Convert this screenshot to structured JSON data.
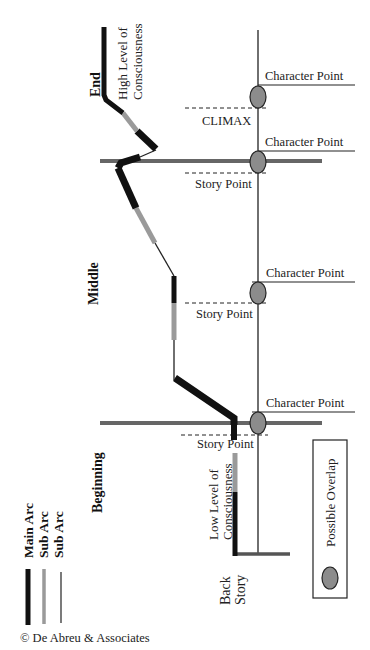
{
  "diagram": {
    "sections": [
      {
        "label": "End"
      },
      {
        "label": "Middle"
      },
      {
        "label": "Beginning"
      }
    ],
    "arc_labels": {
      "high": [
        "High Level of",
        "Consciousness"
      ],
      "low": [
        "Low Level of",
        "Consciousness"
      ],
      "back_story": [
        "Back",
        "Story"
      ]
    },
    "points": {
      "character_point_1": "Character Point",
      "climax": "CLIMAX",
      "character_point_2": "Character Point",
      "story_point_1": "Story Point",
      "character_point_3": "Character Point",
      "story_point_2": "Story Point",
      "character_point_4": "Character Point",
      "story_point_3": "Story Point"
    },
    "legend": {
      "main_arc": "Main Arc",
      "sub_arc_1": "Sub Arc",
      "sub_arc_2": "Sub Arc",
      "possible_overlap": "Possible Overlap"
    },
    "colors": {
      "main_arc": "#111111",
      "sub_arc": "#9a9a9a",
      "section_line": "#666666",
      "overlap_fill": "#8c8c8c"
    },
    "copyright": "© De Abreu & Associates"
  }
}
